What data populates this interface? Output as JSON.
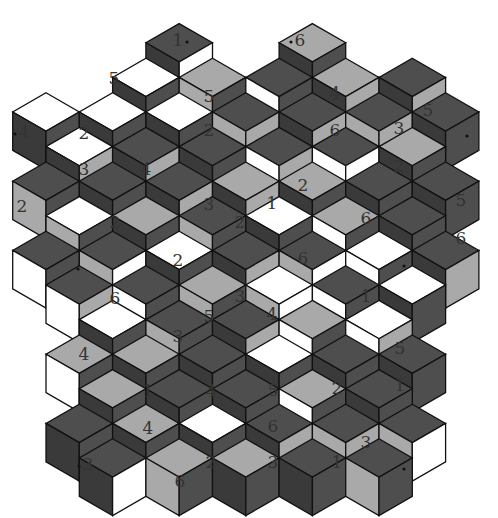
{
  "puzzle": {
    "title": "",
    "colors": {
      "dark": "#3a3a3a",
      "mid": "#4e4e4e",
      "light": "#a9a9a9",
      "white": "#ffffff",
      "line": "#111111"
    },
    "clues": [
      {
        "v": "1",
        "x": 178,
        "y": 40,
        "dot": "right"
      },
      {
        "v": "6",
        "x": 300,
        "y": 40,
        "dot": "left"
      },
      {
        "v": "5",
        "x": 114,
        "y": 78
      },
      {
        "v": "5",
        "x": 209,
        "y": 96
      },
      {
        "v": "4",
        "x": 335,
        "y": 93
      },
      {
        "v": "5",
        "x": 428,
        "y": 110
      },
      {
        "v": "4",
        "x": 24,
        "y": 132,
        "dot": "left"
      },
      {
        "v": "2",
        "x": 84,
        "y": 133
      },
      {
        "v": "2",
        "x": 209,
        "y": 130
      },
      {
        "v": "6",
        "x": 335,
        "y": 130
      },
      {
        "v": "3",
        "x": 399,
        "y": 128
      },
      {
        "v": "3",
        "x": 84,
        "y": 169
      },
      {
        "v": "4",
        "x": 146,
        "y": 169
      },
      {
        "v": "2",
        "x": 399,
        "y": 166
      },
      {
        "v": "2",
        "x": 22,
        "y": 206
      },
      {
        "v": "3",
        "x": 209,
        "y": 204
      },
      {
        "v": "1",
        "x": 272,
        "y": 203
      },
      {
        "v": "2",
        "x": 303,
        "y": 185
      },
      {
        "v": "5",
        "x": 461,
        "y": 200
      },
      {
        "v": "2",
        "x": 115,
        "y": 222
      },
      {
        "v": "2",
        "x": 240,
        "y": 222
      },
      {
        "v": "6",
        "x": 366,
        "y": 218
      },
      {
        "v": "6",
        "x": 461,
        "y": 238
      },
      {
        "v": "2",
        "x": 178,
        "y": 260
      },
      {
        "v": "6",
        "x": 303,
        "y": 258
      },
      {
        "v": "6",
        "x": 115,
        "y": 298
      },
      {
        "v": "3",
        "x": 240,
        "y": 296
      },
      {
        "v": "1",
        "x": 366,
        "y": 296
      },
      {
        "v": "5",
        "x": 209,
        "y": 316
      },
      {
        "v": "4",
        "x": 272,
        "y": 314
      },
      {
        "v": "3",
        "x": 178,
        "y": 336
      },
      {
        "v": "5",
        "x": 400,
        "y": 348
      },
      {
        "v": "4",
        "x": 84,
        "y": 354
      },
      {
        "v": "1",
        "x": 148,
        "y": 391
      },
      {
        "v": "4",
        "x": 211,
        "y": 391
      },
      {
        "v": "5",
        "x": 273,
        "y": 390
      },
      {
        "v": "2",
        "x": 337,
        "y": 388
      },
      {
        "v": "1",
        "x": 400,
        "y": 385
      },
      {
        "v": "4",
        "x": 148,
        "y": 428
      },
      {
        "v": "6",
        "x": 273,
        "y": 426
      },
      {
        "v": "3",
        "x": 366,
        "y": 442
      },
      {
        "v": "3",
        "x": 88,
        "y": 464,
        "dot": "left"
      },
      {
        "v": "2",
        "x": 211,
        "y": 462
      },
      {
        "v": "3",
        "x": 273,
        "y": 462
      },
      {
        "v": "1",
        "x": 337,
        "y": 462
      },
      {
        "v": "6",
        "x": 180,
        "y": 481
      }
    ],
    "edge_dots": [
      {
        "x": 78,
        "y": 269
      },
      {
        "x": 404,
        "y": 266
      },
      {
        "x": 404,
        "y": 469
      },
      {
        "x": 467,
        "y": 136
      }
    ]
  }
}
